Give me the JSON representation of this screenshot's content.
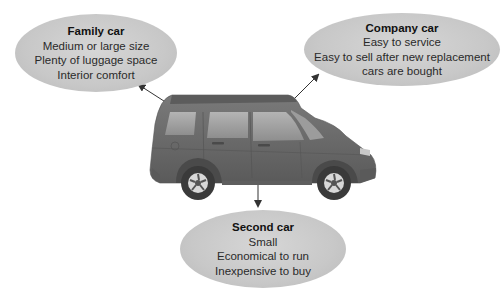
{
  "diagram": {
    "center": {
      "label": "",
      "icon": "suv-car-icon",
      "color": "#6f6f6f"
    },
    "nodes": [
      {
        "id": "family",
        "title": "Family car",
        "lines": [
          "Medium or large size",
          "Plenty of luggage space",
          "Interior comfort"
        ]
      },
      {
        "id": "company",
        "title": "Company car",
        "lines": [
          "Easy to service",
          "Easy to sell after new replacement",
          "cars are bought"
        ]
      },
      {
        "id": "second",
        "title": "Second car",
        "lines": [
          "Small",
          "Economical to run",
          "Inexpensive to buy"
        ]
      }
    ],
    "edges": [
      {
        "from": "car",
        "to": "family"
      },
      {
        "from": "car",
        "to": "company"
      },
      {
        "from": "car",
        "to": "second"
      }
    ],
    "colors": {
      "ellipse_fill": "#c8c8c8",
      "text": "#2a2a2a",
      "arrow": "#333333"
    }
  }
}
